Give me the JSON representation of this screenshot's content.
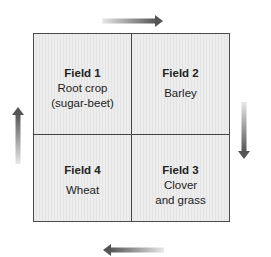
{
  "diagram": {
    "type": "crop-rotation",
    "flow_direction": "clockwise",
    "fields": [
      {
        "position": "top-left",
        "title": "Field 1",
        "crop": "Root crop\n(sugar-beet)"
      },
      {
        "position": "top-right",
        "title": "Field 2",
        "crop": "Barley"
      },
      {
        "position": "bottom-right",
        "title": "Field 3",
        "crop": "Clover\nand grass"
      },
      {
        "position": "bottom-left",
        "title": "Field 4",
        "crop": "Wheat"
      }
    ],
    "arrows": [
      {
        "position": "top",
        "direction": "right"
      },
      {
        "position": "right",
        "direction": "down"
      },
      {
        "position": "bottom",
        "direction": "left"
      },
      {
        "position": "left",
        "direction": "up"
      }
    ],
    "colors": {
      "cell_fill": "#ececec",
      "border": "#4a4a4a",
      "arrow_dark": "#555555",
      "arrow_light": "#e8e8e8",
      "text": "#222222"
    }
  }
}
